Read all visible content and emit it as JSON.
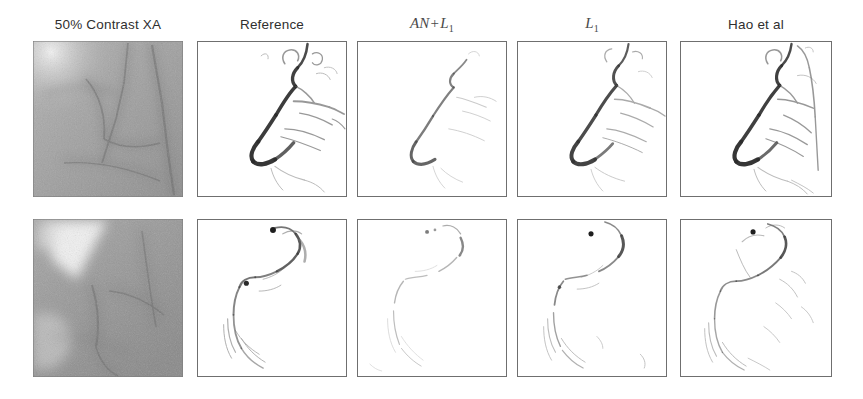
{
  "figure": {
    "type": "image-grid",
    "rows": 2,
    "columns": 5,
    "background_color": "#ffffff",
    "frame_color": "#6f6f6f"
  },
  "columns": [
    {
      "key": "contrast_xa",
      "label": "50% Contrast XA",
      "label_style": "sans",
      "panel_type": "xa-grayscale",
      "framed": false,
      "x": 33,
      "width": 150
    },
    {
      "key": "reference",
      "label": "Reference",
      "label_style": "sans",
      "panel_type": "vessel-map",
      "framed": true,
      "x": 197,
      "width": 150
    },
    {
      "key": "an_l1",
      "label": "AN + L1",
      "label_latex": "AN + L_1",
      "label_style": "math",
      "label_main": "AN",
      "label_op": "+",
      "label_second": "L",
      "label_sub": "1",
      "panel_type": "vessel-map",
      "framed": true,
      "x": 357,
      "width": 150
    },
    {
      "key": "l1",
      "label": "L1",
      "label_latex": "L_1",
      "label_style": "math",
      "label_second": "L",
      "label_sub": "1",
      "panel_type": "vessel-map",
      "framed": true,
      "x": 517,
      "width": 150
    },
    {
      "key": "hao_et_al",
      "label": "Hao et al",
      "label_style": "sans",
      "panel_type": "vessel-map",
      "framed": true,
      "x": 680,
      "width": 152
    }
  ],
  "rows": [
    {
      "key": "case_1",
      "y": 41,
      "height": 156
    },
    {
      "key": "case_2",
      "y": 219,
      "height": 158
    }
  ],
  "header_y": 18,
  "panels": [
    {
      "row": "case_1",
      "column": "contrast_xa",
      "content": "noisy low-contrast x-ray angiogram with faint vessel structures"
    },
    {
      "row": "case_1",
      "column": "reference",
      "content": "extracted vessel tree, thick dark hook-shaped main vessel with branches"
    },
    {
      "row": "case_1",
      "column": "an_l1",
      "content": "extracted vessel tree, thin faint vessel, fewer branches"
    },
    {
      "row": "case_1",
      "column": "l1",
      "content": "extracted vessel tree, moderate darkness with branches"
    },
    {
      "row": "case_1",
      "column": "hao_et_al",
      "content": "extracted vessel tree with background streak artifacts"
    },
    {
      "row": "case_2",
      "column": "contrast_xa",
      "content": "noisy low-contrast x-ray angiogram, bright wedge at upper left"
    },
    {
      "row": "case_2",
      "column": "reference",
      "content": "S-shaped vessel path with dark blobs"
    },
    {
      "row": "case_2",
      "column": "an_l1",
      "content": "S-shaped vessel path, faint and fragmented"
    },
    {
      "row": "case_2",
      "column": "l1",
      "content": "S-shaped vessel path with dark blob, partial branches"
    },
    {
      "row": "case_2",
      "column": "hao_et_al",
      "content": "S-shaped vessel path with extra background artifacts"
    }
  ]
}
